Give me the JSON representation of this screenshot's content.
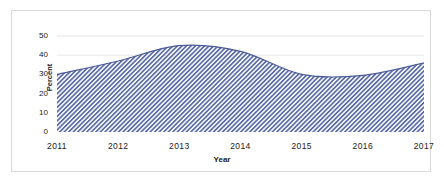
{
  "chart_data": {
    "type": "area",
    "title": "",
    "subtitle": "",
    "xlabel": "Year",
    "ylabel": "Percent",
    "categories": [
      "2011",
      "2012",
      "2013",
      "2014",
      "2015",
      "2016",
      "2017"
    ],
    "x": [
      2011,
      2012,
      2013,
      2014,
      2015,
      2016,
      2017
    ],
    "values": [
      30,
      37,
      45,
      42,
      30,
      29.5,
      36
    ],
    "series": [
      {
        "name": "Percent",
        "values": [
          30,
          37,
          45,
          42,
          30,
          29.5,
          36
        ]
      }
    ],
    "xlim": [
      2011,
      2017
    ],
    "ylim": [
      0,
      50
    ],
    "ytick_labels": [
      "0",
      "10",
      "20",
      "30",
      "40",
      "50"
    ],
    "ytick_values": [
      0,
      10,
      20,
      30,
      40,
      50
    ],
    "xtick_labels": [
      "2011",
      "2012",
      "2013",
      "2014",
      "2015",
      "2016",
      "2017"
    ],
    "grid": true,
    "grid_axis": "y",
    "legend": false,
    "legend_position": "none",
    "fill_pattern": "diagonal-hatch",
    "colors": {
      "fill": "#5a6ba8",
      "fill_background": "#ffffff",
      "line": "#4a5a96",
      "grid": "#e6e6e6",
      "axis_text": "#1a1a1a",
      "frame_border": "#d9d9d9"
    }
  },
  "figure": {
    "y_axis_title": "Percent",
    "x_axis_title": "Year"
  }
}
